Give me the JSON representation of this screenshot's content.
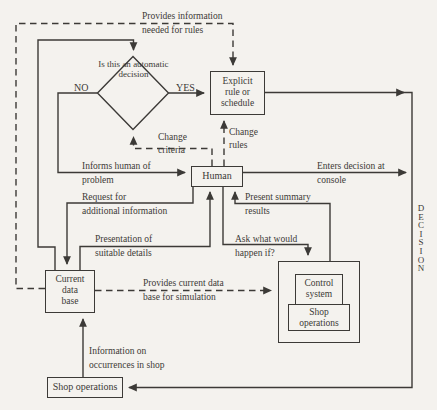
{
  "canvas": {
    "bg": "#f4f2ee",
    "ink": "#3c3a37"
  },
  "nodes": {
    "decision_diamond": {
      "lines": [
        "Is",
        "this",
        "an",
        "automatic",
        "decision"
      ]
    },
    "explicit_rule": {
      "lines": [
        "Explicit",
        "rule or",
        "schedule"
      ]
    },
    "human": {
      "label": "Human"
    },
    "current_data_base": {
      "lines": [
        "Current",
        "data",
        "base"
      ]
    },
    "simulation": {
      "control_system": {
        "lines": [
          "Control",
          "system"
        ]
      },
      "shop_operations": {
        "lines": [
          "Shop",
          "operations"
        ]
      }
    },
    "shop_operations": {
      "label": "Shop operations"
    }
  },
  "branches": {
    "no": "NO",
    "yes": "YES"
  },
  "edge_labels": {
    "provides_info": [
      "Provides information",
      "needed for rules"
    ],
    "change_criteria": [
      "Change",
      "criteria"
    ],
    "change_rules": [
      "Change",
      "rules"
    ],
    "informs_human": [
      "Informs human of",
      "problem"
    ],
    "enters_decision": [
      "Enters decision at",
      "console"
    ],
    "request_additional": [
      "Request for",
      "additional information"
    ],
    "present_summary": [
      "Present summary",
      "results"
    ],
    "presentation_details": [
      "Presentation of",
      "suitable details"
    ],
    "ask_what_if": [
      "Ask what would",
      "happen if?"
    ],
    "provides_current": [
      "Provides current data",
      "base for simulation"
    ],
    "information_occurrences": [
      "Information on",
      "occurrences in shop"
    ],
    "decision_flow": "D\nE\nC\nI\nS\nI\nO\nN"
  }
}
